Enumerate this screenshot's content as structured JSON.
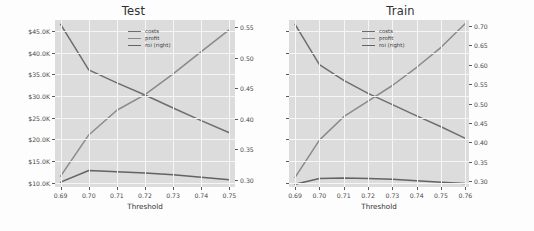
{
  "figure": {
    "background": "#fdfdfd",
    "axes_facecolor": "#dcdcdc",
    "grid_color": "#f6f6f6"
  },
  "series_colors": {
    "costs": "#6e6e6e",
    "profit": "#8a8a8a",
    "roi": "#636363"
  },
  "legend": {
    "costs_label": "costs",
    "profit_label": "profit",
    "roi_label": "roi (right)"
  },
  "panels": [
    {
      "key": "test",
      "title": "Test",
      "xlabel": "Threshold",
      "xticks": [
        "0.69",
        "0.70",
        "0.71",
        "0.72",
        "0.73",
        "0.74",
        "0.75"
      ],
      "yticks_left": [
        "$10.0K",
        "$15.0K",
        "$20.0K",
        "$25.0K",
        "$30.0K",
        "$35.0K",
        "$40.0K",
        "$45.0K"
      ],
      "yticks_right": [
        "0.30",
        "0.35",
        "0.40",
        "0.45",
        "0.50",
        "0.55"
      ],
      "yticks_left_visible": true
    },
    {
      "key": "train",
      "title": "Train",
      "xlabel": "Threshold",
      "xticks": [
        "0.69",
        "0.70",
        "0.71",
        "0.72",
        "0.73",
        "0.74",
        "0.75",
        "0.76"
      ],
      "yticks_left": [
        "",
        "",
        "",
        "",
        "",
        "",
        "",
        ""
      ],
      "yticks_right": [
        "0.30",
        "0.35",
        "0.40",
        "0.45",
        "0.50",
        "0.55",
        "0.60",
        "0.65",
        "0.70"
      ],
      "yticks_left_visible": false
    }
  ],
  "chart_data": [
    {
      "type": "line",
      "title": "Test",
      "xlabel": "Threshold",
      "ylabel": "",
      "y2label": "",
      "xlim": [
        0.688,
        0.752
      ],
      "ylim": [
        9000,
        47500
      ],
      "y2lim": [
        0.288,
        0.562
      ],
      "grid": true,
      "legend_position": "upper center",
      "x": [
        0.69,
        0.7,
        0.71,
        0.72,
        0.73,
        0.74,
        0.75
      ],
      "series": [
        {
          "name": "costs",
          "axis": "left",
          "values": [
            46500,
            36000,
            33000,
            30200,
            27200,
            24300,
            21500
          ]
        },
        {
          "name": "profit",
          "axis": "left",
          "values": [
            11500,
            21000,
            26700,
            30300,
            35100,
            40200,
            45300
          ]
        },
        {
          "name": "roi (right)",
          "axis": "right",
          "values": [
            0.296,
            0.315,
            0.313,
            0.311,
            0.308,
            0.304,
            0.3
          ]
        }
      ]
    },
    {
      "type": "line",
      "title": "Train",
      "xlabel": "Threshold",
      "ylabel": "",
      "y2label": "",
      "xlim": [
        0.6875,
        0.7615
      ],
      "ylim": [
        9000,
        47500
      ],
      "y2lim": [
        0.285,
        0.715
      ],
      "grid": true,
      "legend_position": "upper center",
      "x": [
        0.69,
        0.7,
        0.71,
        0.72,
        0.73,
        0.74,
        0.75,
        0.76
      ],
      "series": [
        {
          "name": "costs",
          "axis": "left",
          "values": [
            46500,
            37200,
            33600,
            30600,
            28000,
            25400,
            22900,
            20200
          ]
        },
        {
          "name": "profit",
          "axis": "left",
          "values": [
            11200,
            19800,
            25200,
            28800,
            32400,
            36600,
            41200,
            46700
          ]
        },
        {
          "name": "roi (right)",
          "axis": "right",
          "values": [
            0.292,
            0.307,
            0.308,
            0.307,
            0.305,
            0.301,
            0.297,
            0.294
          ]
        }
      ]
    }
  ]
}
